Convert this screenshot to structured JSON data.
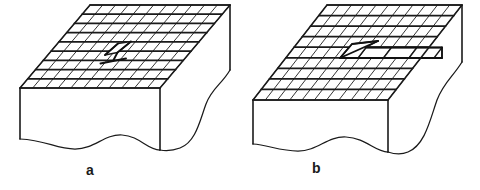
{
  "figure": {
    "title": "",
    "background_color": "#ffffff",
    "line_color": "#1a1a1a",
    "width": 480,
    "height": 190,
    "panels": [
      {
        "id": "panel-a",
        "caption": "a",
        "description": "Crystal block with square lattice grid on top face, small localized dislocation loop near centre, broken-away wavy right and bottom edges",
        "defect_type": "dislocation-nucleus",
        "grid_columns": 11,
        "grid_rows": 9
      },
      {
        "id": "panel-b",
        "caption": "b",
        "description": "Crystal block with square lattice grid on top face, extended wedge-shaped slipped region with a strip of displaced cells running to the right edge, broken-away wavy right and bottom edges",
        "defect_type": "extended-slip-band",
        "grid_columns": 11,
        "grid_rows": 9
      }
    ]
  },
  "captions": {
    "a": "a",
    "b": "b"
  }
}
